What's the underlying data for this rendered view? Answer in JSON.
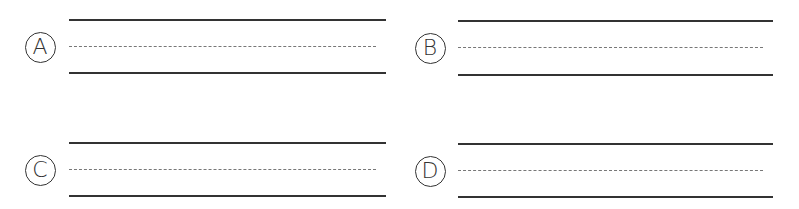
{
  "options": [
    {
      "label": "A",
      "cx": 40,
      "cy": 47,
      "lineX": 69,
      "lineEnd": 386,
      "top": 20,
      "mid": 47,
      "bottom": 73
    },
    {
      "label": "B",
      "cx": 430,
      "cy": 48,
      "lineX": 458,
      "lineEnd": 773,
      "top": 21,
      "mid": 48,
      "bottom": 75
    },
    {
      "label": "C",
      "cx": 40,
      "cy": 170,
      "lineX": 69,
      "lineEnd": 386,
      "top": 143,
      "mid": 170,
      "bottom": 196
    },
    {
      "label": "D",
      "cx": 430,
      "cy": 171,
      "lineX": 458,
      "lineEnd": 773,
      "top": 144,
      "mid": 171,
      "bottom": 197
    }
  ],
  "colors": {
    "line": "#333333",
    "dash": "#777777"
  }
}
